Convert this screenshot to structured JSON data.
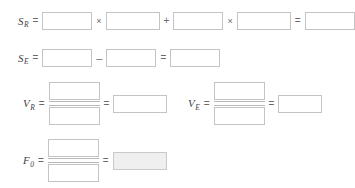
{
  "worksheet": {
    "title": "ANOVA computation worksheet",
    "symbols": {
      "equals": "=",
      "times": "×",
      "plus": "+",
      "minus": "–"
    },
    "rows": [
      {
        "id": "s-r",
        "label_base": "S",
        "label_sub": "R",
        "label_text": "S",
        "fields": [
          {
            "name": "s-r-term1-factor1",
            "value": "",
            "placeholder": ""
          },
          {
            "name": "s-r-term1-factor2",
            "value": "",
            "placeholder": ""
          },
          {
            "name": "s-r-term2-factor1",
            "value": "",
            "placeholder": ""
          },
          {
            "name": "s-r-term2-factor2",
            "value": "",
            "placeholder": ""
          },
          {
            "name": "s-r-result",
            "value": "",
            "placeholder": ""
          }
        ]
      },
      {
        "id": "s-e",
        "label_base": "S",
        "label_sub": "E",
        "fields": [
          {
            "name": "s-e-minuend",
            "value": "",
            "placeholder": ""
          },
          {
            "name": "s-e-subtrahend",
            "value": "",
            "placeholder": ""
          },
          {
            "name": "s-e-result",
            "value": "",
            "placeholder": ""
          }
        ]
      },
      {
        "id": "v-r",
        "label_base": "V",
        "label_sub": "R",
        "fields": [
          {
            "name": "v-r-numerator",
            "value": "",
            "placeholder": ""
          },
          {
            "name": "v-r-denominator",
            "value": "",
            "placeholder": ""
          },
          {
            "name": "v-r-result",
            "value": "",
            "placeholder": ""
          }
        ]
      },
      {
        "id": "v-e",
        "label_base": "V",
        "label_sub": "E",
        "fields": [
          {
            "name": "v-e-numerator",
            "value": "",
            "placeholder": ""
          },
          {
            "name": "v-e-denominator",
            "value": "",
            "placeholder": ""
          },
          {
            "name": "v-e-result",
            "value": "",
            "placeholder": ""
          }
        ]
      },
      {
        "id": "f-0",
        "label_base": "F",
        "label_sub": "0",
        "fields": [
          {
            "name": "f-0-numerator",
            "value": "",
            "placeholder": ""
          },
          {
            "name": "f-0-denominator",
            "value": "",
            "placeholder": ""
          },
          {
            "name": "f-0-result",
            "value": "",
            "placeholder": ""
          }
        ]
      }
    ],
    "colors": {
      "box_border": "#c4c4c4",
      "box_fill": "#ffffff",
      "shaded_fill": "#efefef",
      "text": "#3f3f3f",
      "operator": "#6a6a6a",
      "page_background": "#ffffff"
    }
  }
}
